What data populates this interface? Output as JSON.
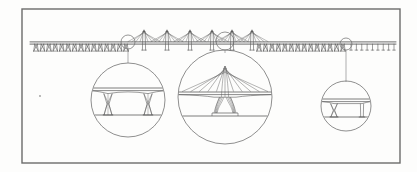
{
  "figure": {
    "kind": "engineering-line-drawing",
    "canvas": {
      "width": 417,
      "height": 172
    },
    "background_color": "#fdfdfc",
    "ink_color": "#5a5a5a",
    "ink_color_dark": "#3f3f3f"
  },
  "frame": {
    "name": "drawing-border",
    "x": 22,
    "y": 9,
    "width": 378,
    "height": 154,
    "stroke": "#6b6b6b",
    "stroke_width": 1.4
  },
  "elevation": {
    "deck_y": 43,
    "deck_x_start": 30,
    "deck_x_end": 396,
    "deck_thickness": 2.2,
    "label": "bridge-deck-elevation",
    "segments": [
      {
        "name": "left-approach-viaduct",
        "type": "x-pier-viaduct",
        "x_start": 36,
        "x_end": 126,
        "pier_count": 15,
        "pier_height": 7,
        "pier_style": "x-braced"
      },
      {
        "name": "cable-stayed-main-section",
        "type": "cable-stayed",
        "x_start": 134,
        "x_end": 256,
        "pylon_count": 6,
        "pylon_height": 13,
        "pylon_positions": [
          144,
          167,
          190,
          212,
          232,
          252
        ],
        "cable_fan_count": 4,
        "cable_half_span": 16
      },
      {
        "name": "right-approach-viaduct",
        "type": "x-pier-viaduct",
        "x_start": 259,
        "x_end": 343,
        "pier_count": 14,
        "pier_height": 7,
        "pier_style": "x-braced"
      },
      {
        "name": "right-end-trestle",
        "type": "simple-pier-trestle",
        "x_start": 351,
        "x_end": 394,
        "pier_count": 9,
        "pier_height": 6,
        "pier_style": "vertical"
      }
    ]
  },
  "callouts": [
    {
      "name": "detail-callout-left",
      "marker": {
        "cx": 128,
        "cy": 42,
        "r": 7
      },
      "leader": {
        "x1": 128,
        "y1": 49,
        "x2": 128,
        "y2": 63
      },
      "detail_circle": {
        "cx": 128,
        "cy": 100,
        "r": 37
      },
      "detail_type": "twin-x-pier-viaduct-detail",
      "deck_y": 88,
      "water_y": 115,
      "piers": [
        108,
        148
      ],
      "pier_style": "x-braced-twin"
    },
    {
      "name": "detail-callout-center",
      "marker": {
        "cx": 225,
        "cy": 41,
        "r": 9
      },
      "leader": {
        "x1": 225,
        "y1": 50,
        "x2": 225,
        "y2": 53
      },
      "detail_circle": {
        "cx": 225,
        "cy": 97,
        "r": 47
      },
      "detail_type": "cable-stayed-pylon-detail",
      "deck_y": 92,
      "water_y": 116,
      "pylon_x": 225,
      "pylon_apex_y": 66,
      "cable_fan_count": 5,
      "cable_half_span": 43,
      "pier_style": "splayed-v-pylon"
    },
    {
      "name": "detail-callout-right",
      "marker": {
        "cx": 346,
        "cy": 44,
        "r": 6
      },
      "leader": {
        "x1": 346,
        "y1": 50,
        "x2": 346,
        "y2": 82
      },
      "detail_circle": {
        "cx": 346,
        "cy": 106,
        "r": 25
      },
      "detail_type": "single-v-pier-deck-detail",
      "deck_y": 99,
      "water_y": 117,
      "piers": [
        334,
        362
      ],
      "pier_style": "v-pier"
    }
  ],
  "annotations": {
    "stray_mark": {
      "name": "stray-ink-mark",
      "x": 40,
      "y": 96,
      "size": 1.4
    }
  }
}
